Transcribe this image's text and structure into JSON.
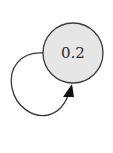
{
  "diagram": {
    "type": "state-transition",
    "nodes": [
      {
        "id": "n1",
        "label": "0.2",
        "fill": "#e6e6e6",
        "stroke": "#3a3a3a"
      }
    ],
    "edges": [
      {
        "from": "n1",
        "to": "n1",
        "kind": "self-loop",
        "directed": true,
        "label": ""
      }
    ]
  },
  "colors": {
    "background": "#ffffff",
    "node_fill": "#e6e6e6",
    "stroke": "#3a3a3a",
    "arrowhead": "#111111"
  }
}
